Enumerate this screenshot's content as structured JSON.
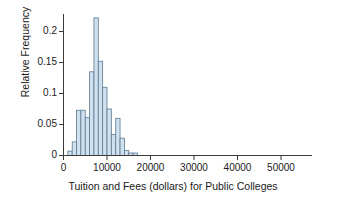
{
  "chart_data": {
    "type": "bar",
    "title": "",
    "xlabel": "Tuition and Fees (dollars) for Public Colleges",
    "ylabel": "Relative Frequency",
    "xlim": [
      0,
      55000
    ],
    "ylim": [
      0,
      0.232
    ],
    "grid": false,
    "legend": false,
    "bin_width": 1000,
    "x_ticks": [
      0,
      10000,
      20000,
      30000,
      40000,
      50000
    ],
    "x_tick_labels": [
      "0",
      "10000",
      "20000",
      "30000",
      "40000",
      "50000"
    ],
    "y_ticks": [
      0,
      0.05,
      0.1,
      0.15,
      0.2
    ],
    "y_tick_labels": [
      "0",
      "0.05",
      "0.1",
      "0.15",
      "0.2"
    ],
    "bar_fill_color": "#cfe0ef",
    "bar_edge_color": "#5c7a92",
    "axis_color": "#3a3a3a",
    "bins": [
      {
        "x0": 1000,
        "x1": 2000,
        "value": 0.007
      },
      {
        "x0": 2000,
        "x1": 3000,
        "value": 0.022
      },
      {
        "x0": 3000,
        "x1": 4000,
        "value": 0.073
      },
      {
        "x0": 4000,
        "x1": 5000,
        "value": 0.073
      },
      {
        "x0": 5000,
        "x1": 6000,
        "value": 0.061
      },
      {
        "x0": 6000,
        "x1": 7000,
        "value": 0.135
      },
      {
        "x0": 7000,
        "x1": 8000,
        "value": 0.222
      },
      {
        "x0": 8000,
        "x1": 9000,
        "value": 0.152
      },
      {
        "x0": 9000,
        "x1": 10000,
        "value": 0.11
      },
      {
        "x0": 10000,
        "x1": 11000,
        "value": 0.075
      },
      {
        "x0": 11000,
        "x1": 12000,
        "value": 0.034
      },
      {
        "x0": 12000,
        "x1": 13000,
        "value": 0.06
      },
      {
        "x0": 13000,
        "x1": 14000,
        "value": 0.028
      },
      {
        "x0": 14000,
        "x1": 15000,
        "value": 0.008
      },
      {
        "x0": 15000,
        "x1": 16000,
        "value": 0.004
      },
      {
        "x0": 16000,
        "x1": 17000,
        "value": 0.004
      }
    ]
  }
}
